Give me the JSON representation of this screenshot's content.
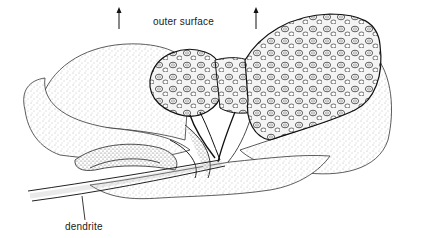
{
  "diagram": {
    "labels": {
      "outer_surface": "outer surface",
      "dendrite": "dendrite"
    },
    "arrows": [
      {
        "name": "outer-surface-arrow-left",
        "direction": "up"
      },
      {
        "name": "outer-surface-arrow-right",
        "direction": "up"
      }
    ],
    "colors": {
      "ink": "#1a1a1a",
      "stipple": "#555555",
      "background": "#ffffff"
    }
  }
}
